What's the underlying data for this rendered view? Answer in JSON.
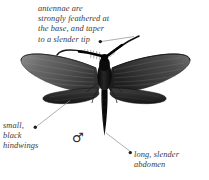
{
  "figure": {
    "background_color": "#ffffff",
    "text_color": "#3a3a3a",
    "body_color": "#121212",
    "wing_color_left": "#5d5d5d",
    "wing_color_right": "#3f3f3f",
    "hindwing_color": "#2a2a2a",
    "leader_line_color": "#8c8c8c"
  },
  "annotations": {
    "antennae": {
      "name": "antennae-callout",
      "lines": [
        "antennae are",
        "strongly feathered at",
        "the base, and taper",
        "to a slender tip"
      ],
      "text": "antennae are\nstrongly feathered at\nthe base, and taper\nto a slender tip"
    },
    "hindwings": {
      "name": "hindwings-callout",
      "lines": [
        "small,",
        "black",
        "hindwings"
      ],
      "text": "small,\nblack\nhindwings"
    },
    "abdomen": {
      "name": "abdomen-callout",
      "lines": [
        "long, slender",
        "abdomen"
      ],
      "text": "long, slender\nabdomen"
    }
  },
  "symbols": {
    "male": "♂"
  }
}
